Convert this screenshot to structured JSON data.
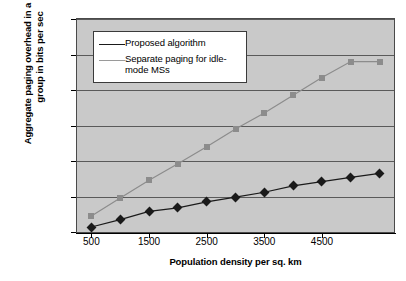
{
  "chart_data": {
    "type": "line",
    "title": "",
    "xlabel": "Population density per sq. km",
    "ylabel": "Aggregate paging overhead in a paging group in bits per sec",
    "xlim": [
      250,
      5750
    ],
    "ylim": [
      0,
      6000
    ],
    "x": [
      500,
      1000,
      1500,
      2000,
      2500,
      3000,
      3500,
      4000,
      4500,
      5000,
      5500
    ],
    "xticks": [
      500,
      1500,
      2500,
      3500,
      4500
    ],
    "xtick_labels": [
      "500",
      "1500",
      "2500",
      "3500",
      "4500"
    ],
    "yticks": [
      0,
      1000,
      2000,
      3000,
      4000,
      5000,
      6000
    ],
    "ytick_labels": [
      "0",
      "1000",
      "2000",
      "3000",
      "4000",
      "5000",
      "6000"
    ],
    "grid": true,
    "grid_axis": "y",
    "legend_position": "upper left",
    "plot_background": "#c9c9c9",
    "series": [
      {
        "name": "Proposed algorithm",
        "marker": "diamond",
        "color": "#1a1a1a",
        "values": [
          140,
          350,
          580,
          680,
          850,
          980,
          1120,
          1300,
          1420,
          1540,
          1650
        ]
      },
      {
        "name": "Separate paging for idle-mode MSs",
        "marker": "square",
        "color": "#8c8c8c",
        "values": [
          450,
          960,
          1460,
          1920,
          2400,
          2900,
          3350,
          3850,
          4350,
          4800,
          4800
        ]
      }
    ]
  },
  "legend": {
    "entries": [
      {
        "label": "Proposed algorithm"
      },
      {
        "label": "Separate paging for idle-mode MSs"
      }
    ]
  },
  "axes": {
    "x_title": "Population density per sq. km",
    "y_title": "Aggregate paging overhead in a paging group in bits per sec"
  }
}
